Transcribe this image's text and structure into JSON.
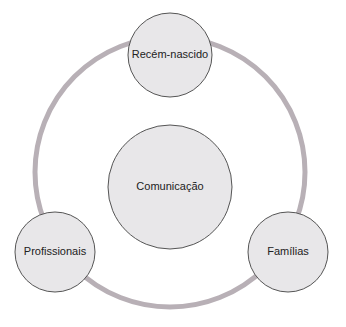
{
  "diagram": {
    "type": "cycle-hub",
    "colors": {
      "ring": "#b8b0b6",
      "node_fill": "#e8e7e9",
      "node_stroke": "#555555",
      "text": "#222222"
    },
    "ring": {
      "cx": 170,
      "cy": 172,
      "r": 135
    },
    "center": {
      "label": "Comunicação",
      "cx": 170,
      "cy": 187,
      "r": 62
    },
    "nodes": [
      {
        "label": "Recém-nascido",
        "cx": 170,
        "cy": 55,
        "r": 42
      },
      {
        "label": "Profissionais",
        "cx": 55,
        "cy": 252,
        "r": 40
      },
      {
        "label": "Famílias",
        "cx": 288,
        "cy": 252,
        "r": 40
      }
    ]
  }
}
